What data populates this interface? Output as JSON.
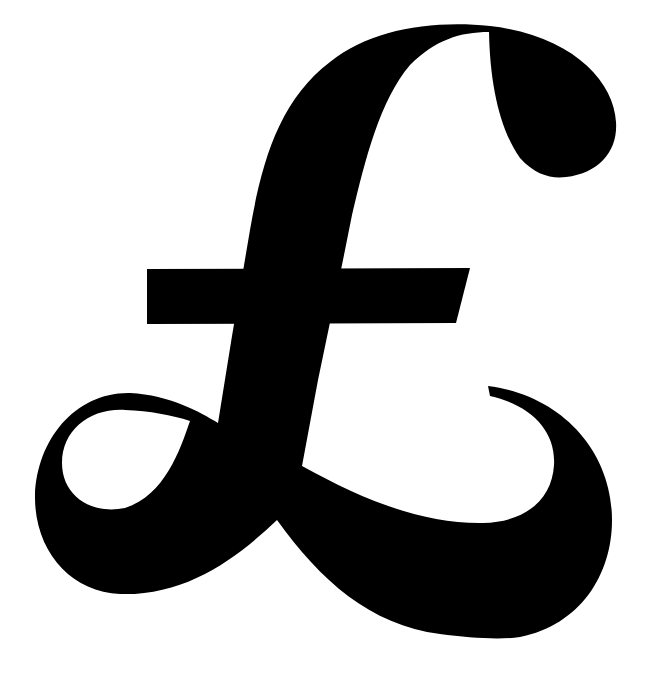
{
  "symbol": {
    "character": "£",
    "name": "pound-sterling-sign",
    "fill_color": "#000000",
    "background_color": "#ffffff"
  }
}
